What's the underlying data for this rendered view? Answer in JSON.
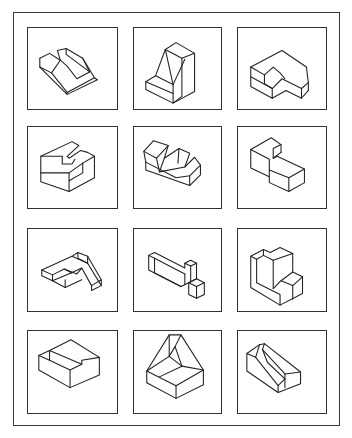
{
  "figure": {
    "title": "",
    "layout": {
      "rows": 4,
      "columns": 3
    },
    "colors": {
      "stroke": "#222222",
      "frame": "#3a3a3a",
      "background": "#ffffff"
    },
    "panels": [
      {
        "id": 1,
        "row": 1,
        "col": 1,
        "shape": "v-notched-wedge-block"
      },
      {
        "id": 2,
        "row": 1,
        "col": 2,
        "shape": "angled-bracket-block"
      },
      {
        "id": 3,
        "row": 1,
        "col": 3,
        "shape": "notched-hexagonal-block"
      },
      {
        "id": 4,
        "row": 2,
        "col": 1,
        "shape": "t-slot-block"
      },
      {
        "id": 5,
        "row": 2,
        "col": 2,
        "shape": "v-trough-block"
      },
      {
        "id": 6,
        "row": 2,
        "col": 3,
        "shape": "stepped-l-block"
      },
      {
        "id": 7,
        "row": 3,
        "col": 1,
        "shape": "hollow-frame-with-ramp"
      },
      {
        "id": 8,
        "row": 3,
        "col": 2,
        "shape": "channel-with-cubes"
      },
      {
        "id": 9,
        "row": 3,
        "col": 3,
        "shape": "stepped-wall-block"
      },
      {
        "id": 10,
        "row": 4,
        "col": 1,
        "shape": "stepped-shelf-block"
      },
      {
        "id": 11,
        "row": 4,
        "col": 2,
        "shape": "pyramidal-frustum-block"
      },
      {
        "id": 12,
        "row": 4,
        "col": 3,
        "shape": "diagonal-slot-block"
      }
    ]
  }
}
